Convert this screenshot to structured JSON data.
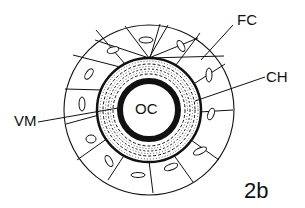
{
  "figure": {
    "panel_label": "2b"
  },
  "labels": {
    "fc": "FC",
    "ch": "CH",
    "vm": "VM",
    "oc": "OC"
  },
  "structure": {
    "center": [
      149,
      110
    ],
    "follicle_cells_count": 14,
    "outer_radius": 86,
    "chorion_outer_radius": 52,
    "vitelline_membrane_radius": 30,
    "oocyte_radius": 24
  },
  "colors": {
    "ink": "#111111",
    "background": "#ffffff"
  }
}
